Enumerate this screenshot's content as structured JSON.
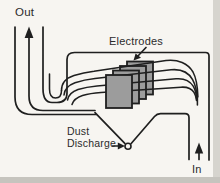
{
  "diagram": {
    "labels": {
      "out": "Out",
      "electrodes": "Electrodes",
      "dust_discharge_line1": "Dust",
      "dust_discharge_line2": "Discharge",
      "in": "In"
    },
    "colors": {
      "ink": "#1f1f1f",
      "text": "#2b2b2b",
      "plate_fill": "#9c9c9c",
      "background": "#f7f5f1",
      "edge_band": "#d6d4ce",
      "edge_band_dark": "#c6c4be"
    },
    "icons": {
      "out_flow_arrow": "up-arrow",
      "in_flow_arrow": "up-arrow",
      "electrodes_pointer": "down-left-arrow",
      "dust_discharge_pointer": "right-arrow"
    },
    "counts": {
      "electrode_plates": 4,
      "flow_lines": 4
    }
  }
}
